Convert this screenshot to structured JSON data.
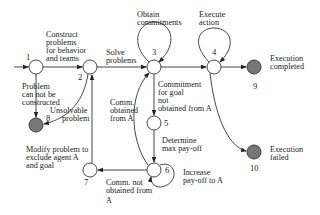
{
  "nodes": [
    {
      "id": "1",
      "label": "1",
      "x": 36,
      "y": 67,
      "filled": false
    },
    {
      "id": "2",
      "label": "2",
      "x": 90,
      "y": 67,
      "filled": false
    },
    {
      "id": "3",
      "label": "3",
      "x": 154,
      "y": 67,
      "filled": false
    },
    {
      "id": "4",
      "label": "4",
      "x": 214,
      "y": 67,
      "filled": false
    },
    {
      "id": "5",
      "label": "5",
      "x": 154,
      "y": 123,
      "filled": false
    },
    {
      "id": "6",
      "label": "6",
      "x": 154,
      "y": 170,
      "filled": false
    },
    {
      "id": "7",
      "label": "7",
      "x": 90,
      "y": 170,
      "filled": false
    },
    {
      "id": "8",
      "label": "8",
      "x": 36,
      "y": 125,
      "filled": true
    },
    {
      "id": "9",
      "label": "9",
      "x": 254,
      "y": 67,
      "filled": true
    },
    {
      "id": "10",
      "label": "10",
      "x": 254,
      "y": 152,
      "filled": true
    }
  ],
  "edge_labels": {
    "construct": [
      "Construct",
      "problems",
      "for behavior",
      "and teams"
    ],
    "solve": [
      "Solve",
      "problems"
    ],
    "obtain": [
      "Obtain",
      "commitments"
    ],
    "execute": [
      "Execute",
      "action"
    ],
    "exec_completed": [
      "Execution",
      "completed"
    ],
    "exec_failed": [
      "Execution",
      "failed"
    ],
    "cannot_construct": [
      "Problem",
      "can not be",
      "constructed"
    ],
    "unsolvable": [
      "Unsolvable",
      "problem"
    ],
    "commitment_not": [
      "Commitment",
      "for goal",
      "not",
      "obtained from A"
    ],
    "comm_obtained": [
      "Comm.",
      "obtained",
      "from A"
    ],
    "determine": [
      "Determine",
      "max pay-off"
    ],
    "increase": [
      "Increase",
      "pay-off to A"
    ],
    "comm_not_obtained": [
      "Comm. not",
      "obtained from",
      "A"
    ],
    "modify": [
      "Modify problem to",
      "exclude agent A",
      "and goal"
    ]
  }
}
